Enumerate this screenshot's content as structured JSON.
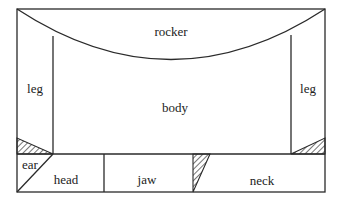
{
  "diagram": {
    "type": "pattern-layout",
    "labels": {
      "rocker": "rocker",
      "leg_left": "leg",
      "leg_right": "leg",
      "body": "body",
      "ear": "ear",
      "head": "head",
      "jaw": "jaw",
      "neck": "neck"
    },
    "colors": {
      "line": "#2a2a2a",
      "background": "#ffffff",
      "text": "#222222"
    },
    "hatched_regions": [
      "left-corner-triangle",
      "right-corner-triangle",
      "jaw-neck-triangle"
    ]
  }
}
